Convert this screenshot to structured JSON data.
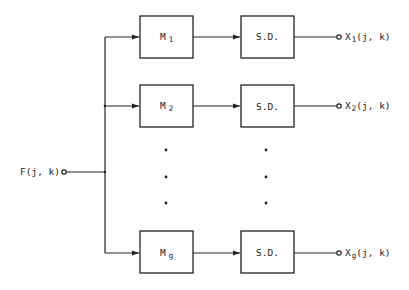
{
  "diagram": {
    "type": "block-diagram",
    "input": {
      "label": "F(j, k)",
      "main": "F",
      "args": "(j, k)"
    },
    "branches": [
      {
        "filter": {
          "main": "M",
          "sub": "1"
        },
        "detector": "S.D.",
        "output": {
          "main": "X",
          "sub": "1",
          "args": "(j, k)"
        }
      },
      {
        "filter": {
          "main": "M",
          "sub": "2"
        },
        "detector": "S.D.",
        "output": {
          "main": "X",
          "sub": "2",
          "args": "(j, k)"
        }
      },
      {
        "filter": {
          "main": "M",
          "sub": "g"
        },
        "detector": "S.D.",
        "output": {
          "main": "X",
          "sub": "g",
          "args": "(j, k)"
        }
      }
    ],
    "ellipsis": "vertical dots between branch 2 and branch g",
    "colors": {
      "line": "#222222",
      "background": "#ffffff"
    }
  }
}
